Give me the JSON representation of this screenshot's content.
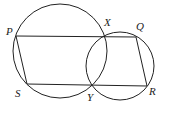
{
  "diagram": {
    "points": {
      "P": {
        "label": "P",
        "x": 16,
        "y": 36
      },
      "X": {
        "label": "X",
        "x": 104,
        "y": 37
      },
      "Q": {
        "label": "Q",
        "x": 136,
        "y": 37
      },
      "R": {
        "label": "R",
        "x": 147,
        "y": 86
      },
      "Y": {
        "label": "Y",
        "x": 93,
        "y": 86
      },
      "S": {
        "label": "S",
        "x": 27,
        "y": 84
      }
    },
    "circles": [
      {
        "name": "large",
        "cx": 60,
        "cy": 51,
        "r": 47
      },
      {
        "name": "small",
        "cx": 120,
        "cy": 66,
        "r": 34
      }
    ]
  }
}
